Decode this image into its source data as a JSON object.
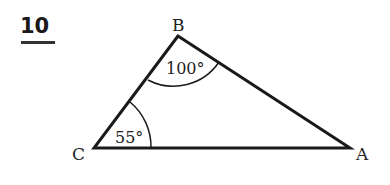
{
  "question": {
    "number": "10"
  },
  "diagram": {
    "type": "triangle",
    "vertices": {
      "A": "A",
      "B": "B",
      "C": "C"
    },
    "angles": {
      "B": "100°",
      "C": "55°"
    }
  }
}
